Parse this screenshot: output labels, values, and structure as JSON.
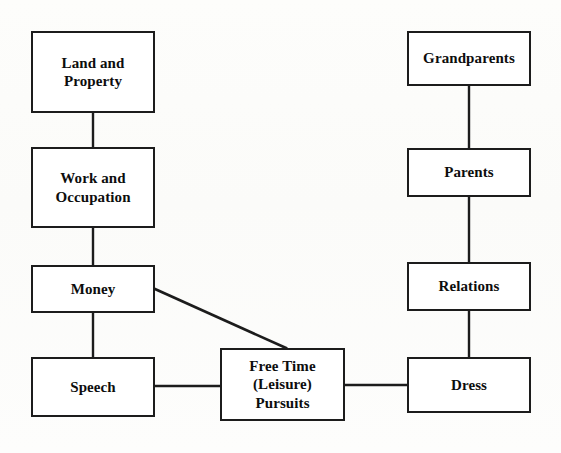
{
  "diagram": {
    "type": "flowchart",
    "title": "",
    "background_color": "#fcfcfa",
    "box_border_color": "#1c1c1c",
    "box_fill_color": "#ffffff",
    "connector_color": "#1c1c1c",
    "nodes": [
      {
        "id": "land-and-property",
        "label": "Land and\nProperty",
        "x": 31,
        "y": 31,
        "w": 124,
        "h": 82,
        "column": "left"
      },
      {
        "id": "work-and-occupation",
        "label": "Work and\nOccupation",
        "x": 31,
        "y": 147,
        "w": 124,
        "h": 81,
        "column": "left"
      },
      {
        "id": "money",
        "label": "Money",
        "x": 31,
        "y": 265,
        "w": 124,
        "h": 48,
        "column": "left"
      },
      {
        "id": "speech",
        "label": "Speech",
        "x": 31,
        "y": 357,
        "w": 124,
        "h": 60,
        "column": "left"
      },
      {
        "id": "free-time-leisure-pursuits",
        "label": "Free Time\n(Leisure)\nPursuits",
        "x": 220,
        "y": 348,
        "w": 125,
        "h": 73,
        "column": "center"
      },
      {
        "id": "grandparents",
        "label": "Grandparents",
        "x": 407,
        "y": 31,
        "w": 124,
        "h": 55,
        "column": "right"
      },
      {
        "id": "parents",
        "label": "Parents",
        "x": 407,
        "y": 148,
        "w": 124,
        "h": 49,
        "column": "right"
      },
      {
        "id": "relations",
        "label": "Relations",
        "x": 407,
        "y": 262,
        "w": 124,
        "h": 49,
        "column": "right"
      },
      {
        "id": "dress",
        "label": "Dress",
        "x": 407,
        "y": 357,
        "w": 124,
        "h": 56,
        "column": "right"
      }
    ],
    "connectors": [
      {
        "id": "land-to-work",
        "from": "land-and-property",
        "to": "work-and-occupation",
        "kind": "vertical",
        "x1": 93,
        "y1": 113,
        "x2": 93,
        "y2": 147
      },
      {
        "id": "work-to-money",
        "from": "work-and-occupation",
        "to": "money",
        "kind": "vertical",
        "x1": 93,
        "y1": 228,
        "x2": 93,
        "y2": 265
      },
      {
        "id": "money-to-speech",
        "from": "money",
        "to": "speech",
        "kind": "vertical",
        "x1": 93,
        "y1": 313,
        "x2": 93,
        "y2": 357
      },
      {
        "id": "money-to-free-time",
        "from": "money",
        "to": "free-time-leisure-pursuits",
        "kind": "diagonal",
        "x1": 155,
        "y1": 289,
        "x2": 286,
        "y2": 348
      },
      {
        "id": "speech-to-free-time",
        "from": "speech",
        "to": "free-time-leisure-pursuits",
        "kind": "horizontal",
        "x1": 155,
        "y1": 386,
        "x2": 220,
        "y2": 386
      },
      {
        "id": "free-time-to-dress",
        "from": "free-time-leisure-pursuits",
        "to": "dress",
        "kind": "horizontal",
        "x1": 345,
        "y1": 385,
        "x2": 407,
        "y2": 385
      },
      {
        "id": "grandparents-to-parents",
        "from": "grandparents",
        "to": "parents",
        "kind": "vertical",
        "x1": 469,
        "y1": 86,
        "x2": 469,
        "y2": 148
      },
      {
        "id": "parents-to-relations",
        "from": "parents",
        "to": "relations",
        "kind": "vertical",
        "x1": 469,
        "y1": 197,
        "x2": 469,
        "y2": 262
      },
      {
        "id": "relations-to-dress",
        "from": "relations",
        "to": "dress",
        "kind": "vertical",
        "x1": 469,
        "y1": 311,
        "x2": 469,
        "y2": 357
      }
    ]
  }
}
